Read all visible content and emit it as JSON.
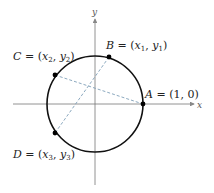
{
  "diagram": {
    "type": "unit-circle",
    "axes": {
      "x_label": "x",
      "y_label": "y"
    },
    "circle": {
      "center": [
        95,
        104
      ],
      "radius": 48
    },
    "points": [
      {
        "id": "A",
        "label": "A = (1, 0)",
        "name": "A",
        "coords": "(1, 0)",
        "pos": [
          143,
          104
        ]
      },
      {
        "id": "B",
        "label": "B = (x₁, y₁)",
        "name": "B",
        "coords": "(x₁, y₁)",
        "pos": [
          109,
          57
        ]
      },
      {
        "id": "C",
        "label": "C = (x₂, y₂)",
        "name": "C",
        "coords": "(x₂, y₂)",
        "pos": [
          55,
          75
        ]
      },
      {
        "id": "D",
        "label": "D = (x₃, y₃)",
        "name": "D",
        "coords": "(x₃, y₃)",
        "pos": [
          55,
          133
        ]
      }
    ],
    "segments": [
      {
        "from": "C",
        "to": "A",
        "style": "dashed"
      },
      {
        "from": "B",
        "to": "D",
        "style": "dashed"
      }
    ],
    "colors": {
      "circle": "#111111",
      "axes": "#777777",
      "dashed": "#7f9fb8",
      "points": "#000000"
    }
  }
}
